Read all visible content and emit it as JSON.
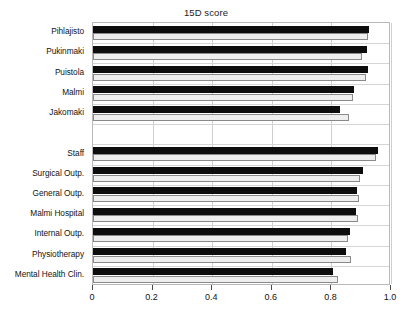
{
  "chart_data": {
    "type": "bar",
    "orientation": "horizontal",
    "title": "15D score",
    "xlabel": "",
    "ylabel": "",
    "xlim": [
      0,
      1.0
    ],
    "xticks": [
      0,
      0.2,
      0.4,
      0.6,
      0.8,
      1.0
    ],
    "xtick_labels": [
      "0",
      "0.2",
      "0.4",
      "0.6",
      "0.8",
      "1.0"
    ],
    "grid": true,
    "legend": "none",
    "categories": [
      "Pihlajisto",
      "Pukinmaki",
      "Puistola",
      "Malmi",
      "Jakomaki",
      "",
      "Staff",
      "Surgical Outp.",
      "General Outp.",
      "Malmi Hospital",
      "Internal Outp.",
      "Physiotherapy",
      "Mental Health Clin."
    ],
    "series": [
      {
        "name": "series-dark",
        "color": "#0d0d0d",
        "values": [
          0.925,
          0.92,
          0.922,
          0.875,
          0.83,
          null,
          0.955,
          0.905,
          0.885,
          0.882,
          0.862,
          0.848,
          0.805
        ]
      },
      {
        "name": "series-light",
        "color": "#eeeeee",
        "values": [
          0.923,
          0.903,
          0.915,
          0.872,
          0.86,
          null,
          0.948,
          0.895,
          0.893,
          0.888,
          0.855,
          0.865,
          0.822
        ]
      }
    ]
  }
}
